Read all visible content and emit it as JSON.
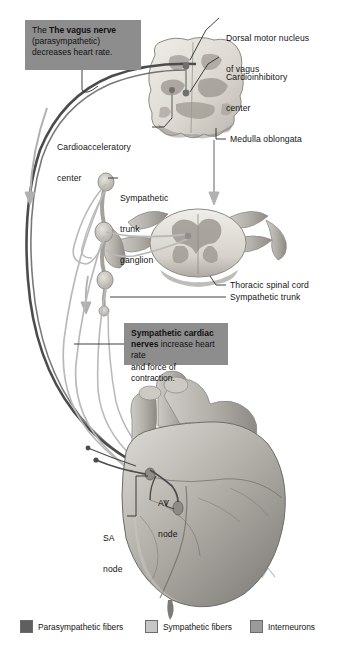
{
  "figure": {
    "callouts": [
      {
        "name": "vagus-nerve-callout",
        "bold": "The vagus nerve",
        "line1": "The ",
        "line2": "(parasympathetic)",
        "line3": "decreases heart rate.",
        "bg": "#8d8d8d"
      },
      {
        "name": "sympathetic-cardiac-nerves-callout",
        "bold": "Sympathetic cardiac",
        "line2a": "nerves",
        "line2b": " increase heart rate",
        "line3": "and force of contraction.",
        "bg": "#8d8d8d"
      }
    ],
    "labels": [
      {
        "name": "dorsal-motor-nucleus-label",
        "line1": "Dorsal motor nucleus",
        "line2": "of vagus"
      },
      {
        "name": "cardioinhibitory-center-label",
        "line1": "Cardioinhibitory",
        "line2": "center"
      },
      {
        "name": "cardioacceleratory-center-label",
        "line1": "Cardioacceleratory",
        "line2": "center"
      },
      {
        "name": "medulla-oblongata-label",
        "line1": "Medulla oblongata"
      },
      {
        "name": "sympathetic-trunk-ganglion-label",
        "line1": "Sympathetic",
        "line2": "trunk",
        "line3": "ganglion"
      },
      {
        "name": "thoracic-spinal-cord-label",
        "line1": "Thoracic spinal cord"
      },
      {
        "name": "sympathetic-trunk-label",
        "line1": "Sympathetic trunk"
      },
      {
        "name": "av-node-label",
        "line1": "AV",
        "line2": "node"
      },
      {
        "name": "sa-node-label",
        "line1": "SA",
        "line2": "node"
      }
    ],
    "legend": {
      "items": [
        {
          "name": "legend-parasympathetic",
          "label": "Parasympathetic fibers",
          "color": "#5f5f5f"
        },
        {
          "name": "legend-sympathetic",
          "label": "Sympathetic fibers",
          "color": "#c6c6c6"
        },
        {
          "name": "legend-interneurons",
          "label": "Interneurons",
          "color": "#9a9a9a"
        }
      ]
    },
    "colors": {
      "parasympathetic_fiber": "#4c4c4c",
      "sympathetic_fiber": "#b9b9b9",
      "interneuron": "#9a9a9a",
      "callout_bg": "#8d8d8d",
      "tissue_light": "#e8e6e1",
      "tissue_mid": "#b5b2ad",
      "tissue_dark": "#8a8782"
    }
  }
}
